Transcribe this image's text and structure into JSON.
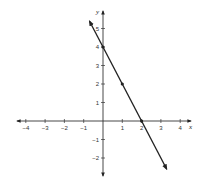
{
  "chart_data": {
    "type": "line",
    "title": "",
    "xlabel": "x",
    "ylabel": "y",
    "xlim": [
      -4,
      4
    ],
    "ylim": [
      -2,
      5
    ],
    "xticks": [
      -4,
      -3,
      -2,
      -1,
      1,
      2,
      3,
      4
    ],
    "yticks": [
      -2,
      -1,
      1,
      2,
      3,
      4,
      5
    ],
    "xtick_labels": [
      "−4",
      "−3",
      "−2",
      "−1",
      "1",
      "2",
      "3",
      "4"
    ],
    "ytick_labels": [
      "−2",
      "−1",
      "1",
      "2",
      "3",
      "4",
      "5"
    ],
    "grid": false,
    "legend": null,
    "series": [
      {
        "name": "line",
        "equation": "y = -2x + 4",
        "points": [
          {
            "x": 0,
            "y": 4
          },
          {
            "x": 1,
            "y": 2
          },
          {
            "x": 2,
            "y": 0
          }
        ],
        "extent": {
          "x_start": -0.7,
          "y_start": 5.4,
          "x_end": 3.3,
          "y_end": -2.6
        },
        "color": "#222222",
        "arrows_both_ends": true
      }
    ]
  },
  "colors": {
    "axis": "#333333",
    "line": "#222222",
    "background": "#ffffff"
  }
}
